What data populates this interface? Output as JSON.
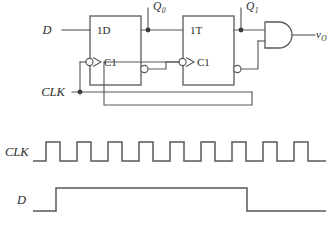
{
  "figure": {
    "type": "digital-logic-schematic-with-timing-diagram",
    "background": "#ffffff",
    "line_color": "#5a5a5a"
  },
  "schematic": {
    "inputs": {
      "d_label": "D",
      "clk_label": "CLK"
    },
    "outputs": {
      "vo_label": "v",
      "vo_sub": "O"
    },
    "nodes": [
      {
        "label": "Q",
        "sub": "0"
      },
      {
        "label": "Q",
        "sub": "1"
      }
    ],
    "flipflops": [
      {
        "name": "d-flip-flop",
        "data_pin": "1D",
        "clock_pin": "C1",
        "clock_inverted": true,
        "q_bar_inverted": true
      },
      {
        "name": "t-flip-flop",
        "data_pin": "1T",
        "clock_pin": "C1",
        "clock_inverted": true,
        "q_bar_inverted": true
      }
    ],
    "gates": [
      {
        "name": "and-gate",
        "type": "AND",
        "inputs": 2
      }
    ]
  },
  "timing": {
    "traces": [
      {
        "name": "clk-waveform",
        "label": "CLK",
        "kind": "clock",
        "pulses": 9,
        "period_px": 31,
        "high_px": 14,
        "start_x": 33,
        "first_edge_x": 46,
        "end_x": 326,
        "baseline_y": 161,
        "high_y": 142
      },
      {
        "name": "d-waveform",
        "label": "D",
        "kind": "pulse",
        "start_x": 33,
        "rise_x": 56,
        "fall_x": 247,
        "end_x": 326,
        "baseline_y": 211,
        "high_y": 188
      }
    ]
  }
}
